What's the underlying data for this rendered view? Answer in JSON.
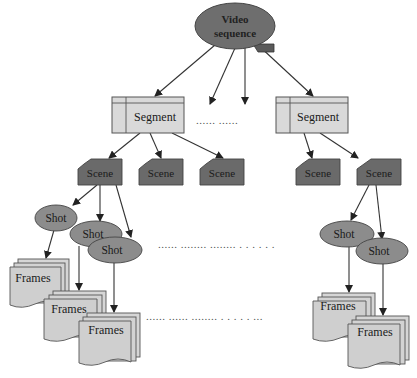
{
  "diagram": {
    "colors": {
      "root_fill": "#6e6e6e",
      "segment_fill": "#d9d9d9",
      "scene_fill": "#6a6a6a",
      "shot_fill": "#8c8c8c",
      "frames_fill": "#cfcfcf",
      "edge": "#222222"
    },
    "root": {
      "label_line1": "Video",
      "label_line2": "sequence"
    },
    "segments": [
      {
        "label": "Segment"
      },
      {
        "label": "Segment"
      }
    ],
    "scenes": [
      {
        "label": "Scene"
      },
      {
        "label": "Scene"
      },
      {
        "label": "Scene"
      },
      {
        "label": "Scene"
      },
      {
        "label": "Scene"
      }
    ],
    "shots": [
      {
        "label": "Shot"
      },
      {
        "label": "Shot"
      },
      {
        "label": "Shot"
      },
      {
        "label": "Shot"
      },
      {
        "label": "Shot"
      }
    ],
    "frames": [
      {
        "label": "Frames"
      },
      {
        "label": "Frames"
      },
      {
        "label": "Frames"
      },
      {
        "label": "Frames"
      },
      {
        "label": "Frames"
      }
    ],
    "ellipses": {
      "segment_level": "...... ......",
      "shot_level": "...... ........ ........  . . . . . .",
      "frames_level": "...... ......  ........  . . . . . ..."
    }
  }
}
